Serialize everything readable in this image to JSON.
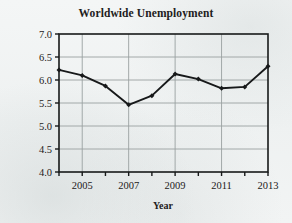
{
  "figure": {
    "background_color": "#f1f3f3",
    "ink_color": "#17191a",
    "grid_color": "#9aa0a0"
  },
  "chart_data": {
    "type": "line",
    "title": "Worldwide Unemployment",
    "xlabel": "Year",
    "ylabel": "Rate (as a %)",
    "x": [
      2004,
      2005,
      2006,
      2007,
      2008,
      2009,
      2010,
      2011,
      2012,
      2013
    ],
    "values": [
      6.22,
      6.1,
      5.87,
      5.46,
      5.66,
      6.13,
      6.02,
      5.82,
      5.85,
      6.3
    ],
    "series": [
      {
        "name": "Worldwide unemployment rate",
        "values": [
          6.22,
          6.1,
          5.87,
          5.46,
          5.66,
          6.13,
          6.02,
          5.82,
          5.85,
          6.3
        ]
      }
    ],
    "xlim": [
      2004,
      2013
    ],
    "ylim": [
      4.0,
      7.0
    ],
    "ytick_labels": [
      "4.0",
      "4.5",
      "5.0",
      "5.5",
      "6.0",
      "6.5",
      "7.0"
    ],
    "ytick_values": [
      4.0,
      4.5,
      5.0,
      5.5,
      6.0,
      6.5,
      7.0
    ],
    "xtick_values": [
      2004,
      2005,
      2006,
      2007,
      2008,
      2009,
      2010,
      2011,
      2012,
      2013
    ],
    "xtick_labels": [
      "",
      "2005",
      "",
      "2007",
      "",
      "2009",
      "",
      "2011",
      "",
      "2013"
    ],
    "grid": true,
    "legend": null,
    "marker": "diamond",
    "line_color": "#17191a",
    "annotations": []
  }
}
